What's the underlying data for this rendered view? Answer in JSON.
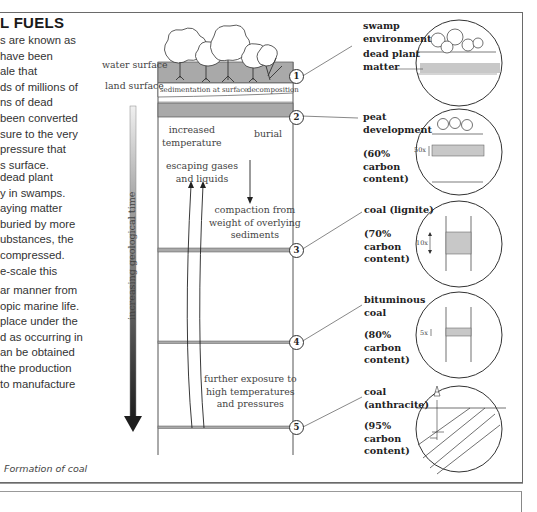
{
  "page": {
    "title": "L FUELS",
    "intro_paragraph_lines": [
      "s are known as",
      "have been",
      "ale that",
      "ds of millions of",
      "ns of dead",
      "been converted",
      "sure to the very",
      "pressure that",
      "s surface."
    ],
    "second_paragraph_lines": [
      "dead plant",
      "y in swamps.",
      "aying matter",
      "buried by more",
      "ubstances, the",
      "compressed.",
      "e-scale this"
    ],
    "third_paragraph_lines": [
      "ar manner from",
      "opic marine life.",
      "place under the",
      "d as occurring in",
      "an be obtained",
      "the production",
      "to manufacture"
    ],
    "caption": "Formation of coal"
  },
  "diagram": {
    "left_labels": {
      "water_surface": "water surface",
      "land_surface": "land surface"
    },
    "axis_label": "increasing geological time",
    "column_labels": {
      "sedimentation": "sedimentation at surface",
      "decomposition": "decomposition",
      "increased_temperature": [
        "increased",
        "temperature"
      ],
      "burial": "burial",
      "escaping_gases": [
        "escaping gases",
        "and liquids"
      ],
      "compaction": [
        "compaction from",
        "weight of overlying",
        "sediments"
      ],
      "further_exposure": [
        "further exposure to",
        "high temperatures",
        "and pressures"
      ]
    },
    "stages": [
      {
        "number": "1",
        "label_lines": [
          "swamp",
          "environment"
        ],
        "sub_label_lines": [
          "dead plant",
          "matter"
        ],
        "carbon_lines": []
      },
      {
        "number": "2",
        "label_lines": [
          "peat",
          "development"
        ],
        "carbon_lines": [
          "(60%",
          "carbon",
          "content)"
        ],
        "thickness": "50x"
      },
      {
        "number": "3",
        "label_lines": [
          "coal (lignite)"
        ],
        "carbon_lines": [
          "(70%",
          "carbon",
          "content)"
        ],
        "thickness": "10x"
      },
      {
        "number": "4",
        "label_lines": [
          "bituminous",
          "coal"
        ],
        "carbon_lines": [
          "(80%",
          "carbon",
          "content)"
        ],
        "thickness": "5x"
      },
      {
        "number": "5",
        "label_lines": [
          "coal",
          "(anthracite)"
        ],
        "carbon_lines": [
          "(95%",
          "carbon",
          "content)"
        ]
      }
    ],
    "colors": {
      "layer_gray": "#a9a9a9",
      "light_gray": "#c8c8c8",
      "line": "#333333",
      "axis_dark": "#222222"
    }
  }
}
